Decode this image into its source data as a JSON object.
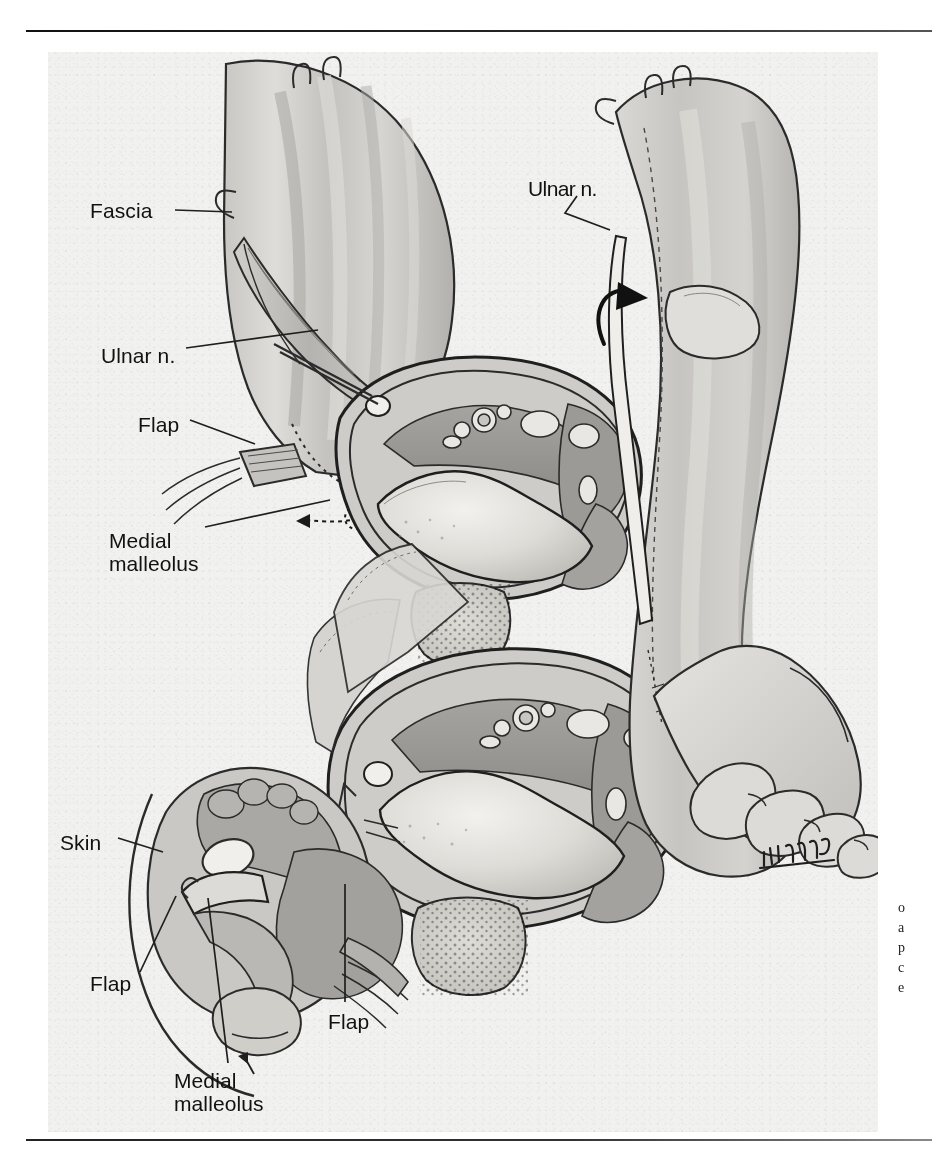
{
  "document": {
    "type": "surgical anatomical illustration",
    "subject": "Ulnar nerve fascial flap of the forearm — cross-sectional anatomy",
    "signature": "illegible cursive artist signature"
  },
  "rules": {
    "top": "horizontal rule",
    "bottom": "horizontal rule"
  },
  "labels": [
    {
      "id": "fascia",
      "text": "Fascia"
    },
    {
      "id": "ulnar-n-left",
      "text": "Ulnar n."
    },
    {
      "id": "flap-upper-left",
      "text": "Flap"
    },
    {
      "id": "medial-malleolus-upper",
      "line1": "Medial",
      "line2": "malleolus"
    },
    {
      "id": "ulnar-n-right",
      "text": "Ulnar n."
    },
    {
      "id": "skin",
      "text": "Skin"
    },
    {
      "id": "flap-lower-left",
      "text": "Flap"
    },
    {
      "id": "medial-malleolus-lower",
      "line1": "Medial",
      "line2": "malleolus"
    },
    {
      "id": "flap-center",
      "text": "Flap"
    }
  ],
  "caption_truncated": {
    "note": "caption text cut off at right page margin",
    "lines": [
      "o",
      "a",
      "p",
      "c",
      "e"
    ]
  },
  "colors": {
    "ink": "#111111",
    "paper": "#f1f1ef",
    "page": "#ffffff",
    "tissue_light": "#d8d7d3",
    "tissue_mid": "#a9a8a4",
    "tissue_dark": "#8d8c88",
    "muscle": "#9a9995",
    "bone": "#e6e5e1",
    "outline": "#2b2b2b"
  }
}
